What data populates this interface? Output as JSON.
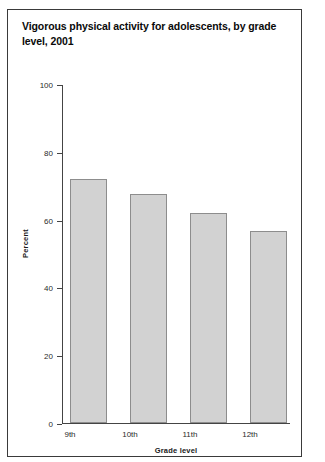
{
  "figure": {
    "title": "Vigorous physical activity for adolescents, by grade level, 2001"
  },
  "chart_data": {
    "type": "bar",
    "title": "Vigorous physical activity for adolescents, by grade level, 2001",
    "xlabel": "Grade level",
    "ylabel": "Percent",
    "categories": [
      "9th",
      "10th",
      "11th",
      "12th"
    ],
    "values": [
      72,
      67.5,
      62,
      56.5
    ],
    "ylim": [
      0,
      100
    ],
    "yticks": [
      0,
      20,
      40,
      60,
      80,
      100
    ],
    "ytick_labels": [
      "0",
      "20",
      "40",
      "60",
      "80",
      "100"
    ],
    "grid": false,
    "legend": "none",
    "bar_fill": "#d2d2d2",
    "bar_edge": "#8d8d8d",
    "axis_color": "#444444"
  }
}
